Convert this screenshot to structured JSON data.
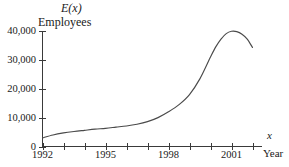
{
  "chart_data": {
    "type": "line",
    "title": "",
    "ylabel_function": "E(x)",
    "ylabel_units": "Employees",
    "xlabel_variable": "x",
    "xlabel_name": "Year",
    "xlim": [
      1992,
      2002.4
    ],
    "ylim": [
      0,
      42000
    ],
    "grid": false,
    "legend": null,
    "y_ticks": [
      0,
      10000,
      20000,
      30000,
      40000
    ],
    "y_tick_labels": [
      "0",
      "10,000",
      "20,000",
      "30,000",
      "40,000"
    ],
    "x_ticks": [
      1992,
      1993,
      1994,
      1995,
      1996,
      1997,
      1998,
      1999,
      2000,
      2001,
      2002
    ],
    "x_tick_labels": [
      "1992",
      "",
      "",
      "1995",
      "",
      "",
      "1998",
      "",
      "",
      "2001",
      ""
    ],
    "x_labeled_ticks": [
      {
        "value": 1992,
        "label": "1992"
      },
      {
        "value": 1995,
        "label": "1995"
      },
      {
        "value": 1998,
        "label": "1998"
      },
      {
        "value": 2001,
        "label": "2001"
      }
    ],
    "series": [
      {
        "name": "E(x)",
        "color": "#4a4a4a",
        "x": [
          1992,
          1992.5,
          1993,
          1993.5,
          1994,
          1994.5,
          1995,
          1995.5,
          1996,
          1996.5,
          1997,
          1997.5,
          1998,
          1998.5,
          1999,
          1999.5,
          2000,
          2000.25,
          2000.5,
          2000.75,
          2001,
          2001.25,
          2001.5,
          2001.75,
          2002
        ],
        "values": [
          3000,
          4000,
          4700,
          5200,
          5600,
          6000,
          6300,
          6700,
          7100,
          7700,
          8600,
          10000,
          12000,
          14500,
          18000,
          23500,
          31000,
          34500,
          37200,
          39100,
          39900,
          39800,
          38900,
          37200,
          34300
        ]
      }
    ],
    "peak": {
      "x": 2001,
      "value": 39900
    },
    "start": {
      "x": 1992,
      "value": 3000
    },
    "end": {
      "x": 2002,
      "value": 34300
    }
  },
  "geometry": {
    "axis_color": "#3a3a3a",
    "curve_color": "#4a4a4a",
    "background": "#ffffff"
  }
}
